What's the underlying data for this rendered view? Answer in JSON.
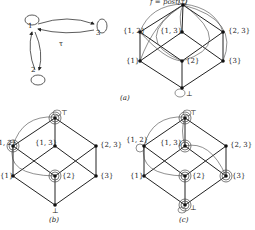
{
  "automaton": {
    "nodes": [
      {
        "id": "1",
        "label": "1"
      },
      {
        "id": "2",
        "label": "2"
      },
      {
        "id": "3",
        "label": "3"
      }
    ],
    "edges": [
      {
        "from": "1",
        "to": "3"
      },
      {
        "from": "3",
        "to": "1"
      },
      {
        "from": "1",
        "to": "2"
      },
      {
        "from": "2",
        "to": "1"
      },
      {
        "from": "1",
        "to": "1",
        "self_loop": true
      },
      {
        "from": "2",
        "to": "2",
        "self_loop": true
      },
      {
        "from": "3",
        "to": "3",
        "self_loop": true
      }
    ],
    "tau_label": "τ"
  },
  "lattice_labels": {
    "top": "⊤",
    "s12": "{1, 2}",
    "s13": "{1, 3}",
    "s23": "{2, 3}",
    "s1": "{1}",
    "s2": "{2}",
    "s3": "{3}",
    "bottom": "⊥"
  },
  "panel_a": {
    "title": "f = post[τ]",
    "caption": "(a)"
  },
  "panel_b": {
    "caption": "(b)",
    "highlighted": [
      "⊤",
      "{1, 2}",
      "{2}"
    ]
  },
  "panel_c": {
    "caption": "(c)",
    "highlighted": [
      "⊤",
      "{1, 2}",
      "{1, 3}",
      "{2}",
      "{3}",
      "⊥"
    ]
  }
}
